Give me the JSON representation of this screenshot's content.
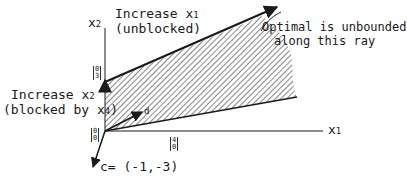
{
  "diagram": {
    "axes": {
      "x_label": "x",
      "x_sub": "1",
      "y_label": "x",
      "y_sub": "2"
    },
    "labels": {
      "increase_x1_line1": "Increase x",
      "increase_x1_sub": "1",
      "increase_x1_line2": "(unblocked)",
      "increase_x2_line1": "Increase x",
      "increase_x2_sub": "2",
      "increase_x2_line2": "(blocked by x",
      "increase_x2_line2_sub": "4",
      "increase_x2_line2_end": ")",
      "optimal_line1": "Optimal is unbounded",
      "optimal_line2": "along this ray",
      "cost_vector": "c= (-1,-3)",
      "direction_vector": "d"
    },
    "points": {
      "origin": [
        "0",
        "0"
      ],
      "point_0_3": [
        "0",
        "3"
      ],
      "point_4_0": [
        "4",
        "0"
      ]
    },
    "colors": {
      "line": "#1a1a1a",
      "hatch": "#444444"
    }
  }
}
